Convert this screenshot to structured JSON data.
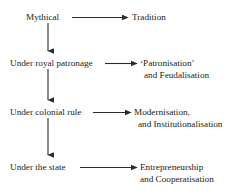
{
  "diagram": {
    "type": "flowchart",
    "orientation": "vertical-chain-with-horizontal-branches",
    "colors": {
      "background": "#ffffff",
      "text": "#1a1a1a",
      "arrow": "#2b2b2b"
    },
    "rows": [
      {
        "stage": "Mythical",
        "outcome_line1": "Tradition",
        "outcome_line2": ""
      },
      {
        "stage": "Under royal patronage",
        "outcome_line1": "‘Patronisation’",
        "outcome_line2": "and Feudalisation"
      },
      {
        "stage": "Under colonial rule",
        "outcome_line1": "Modernisation,",
        "outcome_line2": "and Institutionalisation"
      },
      {
        "stage": "Under the state",
        "outcome_line1": "Entrepreneurship",
        "outcome_line2": "and Cooperatisation"
      }
    ]
  }
}
